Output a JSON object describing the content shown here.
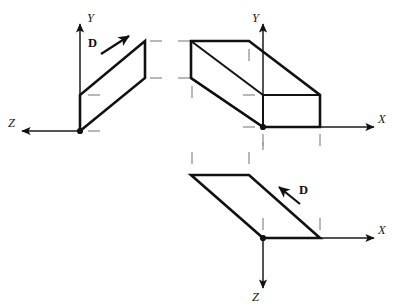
{
  "figure": {
    "background_color": "#ffffff",
    "stroke_color": "#111111",
    "tick_color": "#9a9a9a",
    "width": 393,
    "height": 307
  },
  "panels": [
    {
      "id": "panel-yz",
      "name": "top-left-view",
      "axes": [
        {
          "label": "Y",
          "direction": "up",
          "name": "y-axis"
        },
        {
          "label": "Z",
          "direction": "left",
          "name": "z-axis"
        }
      ],
      "origin_label": "O",
      "vector": {
        "label": "D",
        "direction": "up-right"
      },
      "shape": "parallelogram",
      "tick_count": 4
    },
    {
      "id": "panel-xy",
      "name": "top-right-view",
      "axes": [
        {
          "label": "Y",
          "direction": "up",
          "name": "y-axis"
        },
        {
          "label": "X",
          "direction": "right",
          "name": "x-axis"
        }
      ],
      "origin_label": "O",
      "vector": null,
      "shape": "rectangular-box",
      "tick_count": 8
    },
    {
      "id": "panel-xz",
      "name": "bottom-view",
      "axes": [
        {
          "label": "X",
          "direction": "right",
          "name": "x-axis"
        },
        {
          "label": "Z",
          "direction": "down",
          "name": "z-axis"
        }
      ],
      "origin_label": "O",
      "vector": {
        "label": "D",
        "direction": "up-left"
      },
      "shape": "parallelogram",
      "tick_count": 5
    }
  ],
  "labels": {
    "y_axis_left": "Y",
    "z_axis_left": "Z",
    "d_vector_left": "D",
    "y_axis_mid": "Y",
    "x_axis_mid": "X",
    "x_axis_bottom": "X",
    "z_axis_bottom": "Z",
    "d_vector_bottom": "D"
  }
}
